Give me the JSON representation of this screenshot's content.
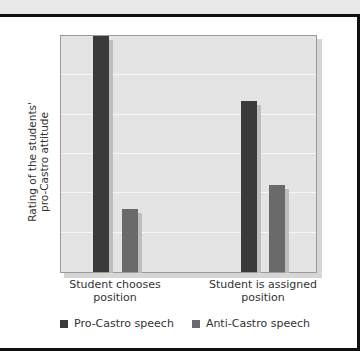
{
  "chart_data": {
    "type": "bar",
    "title": "",
    "xlabel": "",
    "ylabel": "Rating of the students' pro-Castro attitude",
    "categories": [
      "Student chooses position",
      "Student is assigned position"
    ],
    "series": [
      {
        "name": "Pro-Castro speech",
        "values": [
          6.0,
          4.35
        ],
        "color": "#3a3a3a"
      },
      {
        "name": "Anti-Castro speech",
        "values": [
          1.6,
          2.2
        ],
        "color": "#6a6a6a"
      }
    ],
    "ylim": [
      0,
      6
    ],
    "grid": true,
    "gridlines": [
      1,
      2,
      3,
      4,
      5
    ],
    "tick_labels_shown": false,
    "legend_position": "bottom"
  },
  "labels": {
    "ylabel_line1": "Rating of the students'",
    "ylabel_line2": "pro-Castro attitude",
    "cat1_line1": "Student chooses",
    "cat1_line2": "position",
    "cat2_line1": "Student is assigned",
    "cat2_line2": "position",
    "legend_pro": "Pro-Castro speech",
    "legend_anti": "Anti-Castro speech"
  }
}
